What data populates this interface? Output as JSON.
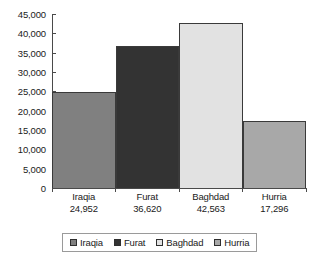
{
  "chart_data": {
    "type": "bar",
    "title": "",
    "subtitle": "",
    "xlabel": "",
    "ylabel": "",
    "categories": [
      "Iraqia",
      "Furat",
      "Baghdad",
      "Hurria"
    ],
    "values": [
      24952,
      36620,
      42563,
      17296
    ],
    "value_labels": [
      "24,952",
      "36,620",
      "42,563",
      "17,296"
    ],
    "ylim": [
      0,
      45000
    ],
    "ytick_values": [
      45000,
      40000,
      35000,
      30000,
      25000,
      20000,
      15000,
      10000,
      5000,
      0
    ],
    "ytick_labels": [
      "45,000",
      "40,000",
      "35,000",
      "30,000",
      "25,000",
      "20,000",
      "15,000",
      "10,000",
      "5,000",
      "0"
    ],
    "grid": false,
    "bar_gap": 0,
    "series": [
      {
        "name": "Iraqia",
        "value": 24952,
        "value_label": "24,952",
        "color": "#808080"
      },
      {
        "name": "Furat",
        "value": 36620,
        "value_label": "36,620",
        "color": "#333333"
      },
      {
        "name": "Baghdad",
        "value": 42563,
        "value_label": "42,563",
        "color": "#e2e2e2"
      },
      {
        "name": "Hurria",
        "value": 17296,
        "value_label": "17,296",
        "color": "#a8a8a8"
      }
    ],
    "legend": {
      "position": "bottom",
      "entries": [
        {
          "label": "Iraqia",
          "color": "#808080"
        },
        {
          "label": "Furat",
          "color": "#333333"
        },
        {
          "label": "Baghdad",
          "color": "#e2e2e2"
        },
        {
          "label": "Hurria",
          "color": "#a8a8a8"
        }
      ]
    },
    "colors": {
      "background": "#ffffff",
      "axis": "#4a4a4a",
      "text": "#1a1a1a",
      "bar_border": "#3a3a3a",
      "legend_border": "#9a9a9a"
    }
  }
}
